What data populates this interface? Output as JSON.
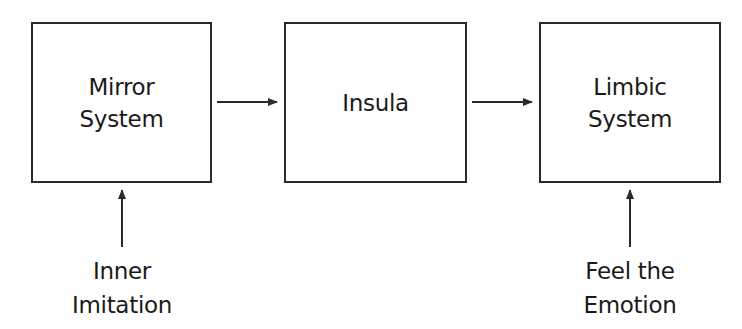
{
  "diagram": {
    "type": "flowchart",
    "nodes": [
      {
        "id": "mirror",
        "label": "Mirror\nSystem"
      },
      {
        "id": "insula",
        "label": "Insula"
      },
      {
        "id": "limbic",
        "label": "Limbic\nSystem"
      }
    ],
    "inputs": [
      {
        "id": "inner",
        "label": "Inner\nImitation",
        "target": "mirror"
      },
      {
        "id": "feel",
        "label": "Feel the\nEmotion",
        "target": "limbic"
      }
    ],
    "edges": [
      {
        "from": "mirror",
        "to": "insula"
      },
      {
        "from": "insula",
        "to": "limbic"
      },
      {
        "from": "inner",
        "to": "mirror"
      },
      {
        "from": "feel",
        "to": "limbic"
      }
    ],
    "colors": {
      "stroke": "#2a2a2a",
      "text": "#1a1a1a",
      "background": "#ffffff"
    }
  }
}
